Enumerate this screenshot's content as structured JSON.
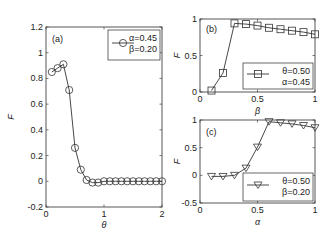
{
  "chart_data": [
    {
      "id": "a",
      "type": "line",
      "panel_label": "(a)",
      "xlabel": "θ",
      "ylabel": "F",
      "xlim": [
        0,
        2
      ],
      "ylim": [
        -0.2,
        1.2
      ],
      "xticks": [
        "0",
        "1",
        "2"
      ],
      "yticks": [
        "-0.2",
        "0",
        "0.2",
        "0.4",
        "0.6",
        "0.8",
        "1",
        "1.2"
      ],
      "grid": false,
      "legend_position": "upper right",
      "marker": "circle",
      "series": [
        {
          "name": "α=0.45, β=0.20",
          "legend_lines": [
            "α=0.45",
            "β=0.20"
          ],
          "x": [
            0.1,
            0.2,
            0.3,
            0.4,
            0.5,
            0.6,
            0.7,
            0.8,
            0.9,
            1.0,
            1.1,
            1.2,
            1.3,
            1.4,
            1.5,
            1.6,
            1.7,
            1.8,
            1.9,
            2.0
          ],
          "values": [
            0.85,
            0.88,
            0.91,
            0.71,
            0.26,
            0.09,
            0.01,
            -0.01,
            -0.01,
            0.0,
            0.0,
            0.0,
            0.0,
            0.0,
            0.0,
            0.0,
            0.0,
            0.0,
            0.0,
            0.0
          ]
        }
      ]
    },
    {
      "id": "b",
      "type": "line",
      "panel_label": "(b)",
      "xlabel": "β",
      "ylabel": "F",
      "xlim": [
        0,
        1
      ],
      "ylim": [
        0,
        1
      ],
      "xticks": [
        "0",
        "0.5",
        "1"
      ],
      "yticks": [
        "0",
        "0.5",
        "1"
      ],
      "grid": false,
      "legend_position": "lower right",
      "marker": "square",
      "series": [
        {
          "name": "θ=0.50, α=0.45",
          "legend_lines": [
            "θ=0.50",
            "α=0.45"
          ],
          "x": [
            0.1,
            0.2,
            0.3,
            0.4,
            0.5,
            0.6,
            0.7,
            0.8,
            0.9,
            1.0
          ],
          "values": [
            0.02,
            0.26,
            0.94,
            0.93,
            0.91,
            0.88,
            0.86,
            0.84,
            0.82,
            0.79
          ]
        }
      ]
    },
    {
      "id": "c",
      "type": "line",
      "panel_label": "(c)",
      "xlabel": "α",
      "ylabel": "F",
      "xlim": [
        0,
        1
      ],
      "ylim": [
        -0.5,
        1
      ],
      "xticks": [
        "0",
        "0.5",
        "1"
      ],
      "yticks": [
        "-0.5",
        "0",
        "0.5",
        "1"
      ],
      "grid": false,
      "legend_position": "lower right",
      "marker": "triangle-down",
      "series": [
        {
          "name": "θ=0.50, β=0.20",
          "legend_lines": [
            "θ=0.50",
            "β=0.20"
          ],
          "x": [
            0.1,
            0.2,
            0.3,
            0.4,
            0.5,
            0.6,
            0.7,
            0.8,
            0.9,
            1.0
          ],
          "values": [
            -0.02,
            -0.02,
            0.0,
            0.13,
            0.51,
            0.97,
            0.95,
            0.93,
            0.9,
            0.86
          ]
        }
      ]
    }
  ]
}
